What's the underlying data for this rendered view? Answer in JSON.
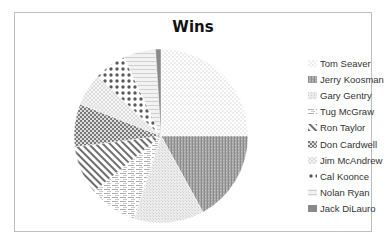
{
  "chart_data": {
    "type": "pie",
    "title": "Wins",
    "categories": [
      "Tom Seaver",
      "Jerry Koosman",
      "Gary Gentry",
      "Tug McGraw",
      "Ron Taylor",
      "Don Cardwell",
      "Jim McAndrew",
      "Cal Koonce",
      "Nolan Ryan",
      "Jack DiLauro"
    ],
    "values": [
      25,
      17,
      13,
      9,
      9,
      8,
      6,
      6,
      6,
      1
    ],
    "patterns": [
      "small-dots",
      "vertical-dense",
      "fine-grid",
      "horizontal-dashes",
      "wide-diagonal",
      "checker",
      "diagonal-trellis",
      "large-diamond-dots",
      "zigzag",
      "solid-dark"
    ],
    "legend": "right",
    "start_angle_deg": 0,
    "direction": "clockwise"
  }
}
